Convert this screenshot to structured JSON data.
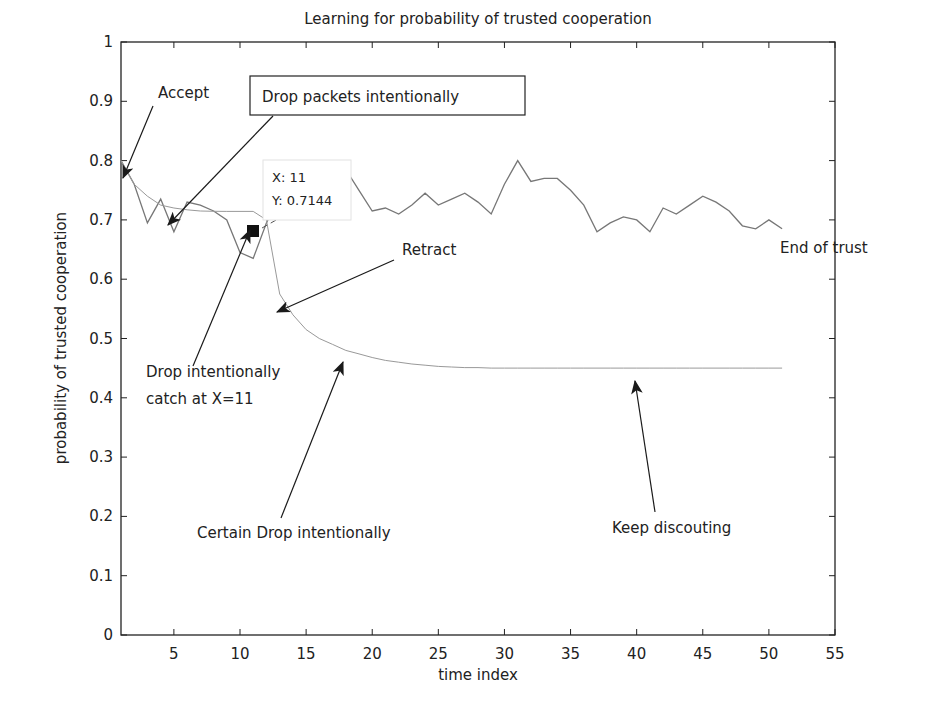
{
  "chart_data": {
    "type": "line",
    "title": "Learning for probability of trusted cooperation",
    "xlabel": "time index",
    "ylabel": "probability of trusted cooperation",
    "xlim": [
      1,
      55
    ],
    "ylim": [
      0,
      1
    ],
    "grid": false,
    "legend": null,
    "xticks": [
      5,
      10,
      15,
      20,
      25,
      30,
      35,
      40,
      45,
      50,
      55
    ],
    "yticks": [
      0,
      0.1,
      0.2,
      0.3,
      0.4,
      0.5,
      0.6,
      0.7,
      0.8,
      0.9,
      1
    ],
    "xtick_labels": [
      "5",
      "10",
      "15",
      "20",
      "25",
      "30",
      "35",
      "40",
      "45",
      "50",
      "55"
    ],
    "ytick_labels": [
      "0",
      "0.1",
      "0.2",
      "0.3",
      "0.4",
      "0.5",
      "0.6",
      "0.7",
      "0.8",
      "0.9",
      "1"
    ],
    "series": [
      {
        "name": "observed cooperation (fluctuating)",
        "color": "#777777",
        "x": [
          1,
          2,
          3,
          4,
          5,
          6,
          7,
          8,
          9,
          10,
          11,
          12,
          13,
          14,
          15,
          16,
          17,
          18,
          19,
          20,
          21,
          22,
          23,
          24,
          25,
          26,
          27,
          28,
          29,
          30,
          31,
          32,
          33,
          34,
          35,
          36,
          37,
          38,
          39,
          40,
          41,
          42,
          43,
          44,
          45,
          46,
          47,
          48,
          49,
          50,
          51
        ],
        "values": [
          0.8,
          0.76,
          0.695,
          0.735,
          0.68,
          0.73,
          0.725,
          0.715,
          0.7,
          0.645,
          0.635,
          0.695,
          0.74,
          0.75,
          0.745,
          0.72,
          0.76,
          0.785,
          0.75,
          0.715,
          0.72,
          0.71,
          0.725,
          0.745,
          0.725,
          0.735,
          0.745,
          0.73,
          0.71,
          0.76,
          0.8,
          0.765,
          0.77,
          0.77,
          0.75,
          0.725,
          0.68,
          0.695,
          0.705,
          0.7,
          0.68,
          0.72,
          0.71,
          0.725,
          0.74,
          0.73,
          0.715,
          0.69,
          0.685,
          0.7,
          0.685
        ]
      },
      {
        "name": "learned trust probability (discounted)",
        "color": "#999999",
        "x": [
          1,
          2,
          3,
          4,
          5,
          6,
          7,
          8,
          9,
          10,
          11,
          12,
          13,
          14,
          15,
          16,
          17,
          18,
          19,
          20,
          21,
          22,
          23,
          24,
          25,
          26,
          27,
          28,
          29,
          30,
          31,
          32,
          33,
          34,
          35,
          36,
          37,
          38,
          39,
          40,
          41,
          42,
          43,
          44,
          45,
          46,
          47,
          48,
          49,
          50,
          51
        ],
        "values": [
          0.8,
          0.76,
          0.74,
          0.725,
          0.72,
          0.717,
          0.715,
          0.7145,
          0.7144,
          0.7144,
          0.7144,
          0.7,
          0.575,
          0.54,
          0.515,
          0.5,
          0.49,
          0.48,
          0.474,
          0.468,
          0.463,
          0.46,
          0.457,
          0.455,
          0.453,
          0.452,
          0.451,
          0.451,
          0.45,
          0.45,
          0.45,
          0.45,
          0.45,
          0.45,
          0.45,
          0.45,
          0.45,
          0.45,
          0.45,
          0.45,
          0.45,
          0.45,
          0.45,
          0.45,
          0.45,
          0.45,
          0.45,
          0.45,
          0.45,
          0.45,
          0.45
        ]
      }
    ],
    "datatip": {
      "x_label": "X: 11",
      "y_label": "Y: 0.7144",
      "x": 11,
      "y": 0.7144
    },
    "annotations": [
      {
        "text": "Accept",
        "target": [
          1,
          0.8
        ]
      },
      {
        "text": "Drop packets intentionally",
        "target": [
          4.2,
          0.72
        ],
        "boxed": true
      },
      {
        "text": "Drop intentionally catch at X=11",
        "lines": [
          "Drop intentionally",
          "catch at X=11"
        ],
        "target": [
          11,
          0.7144
        ]
      },
      {
        "text": "Retract",
        "target": [
          13,
          0.57
        ]
      },
      {
        "text": "Certain Drop intentionally",
        "target": [
          18,
          0.485
        ]
      },
      {
        "text": "Keep discouting",
        "target": [
          39.5,
          0.45
        ]
      },
      {
        "text": "End of trust",
        "target": [
          51,
          0.685
        ]
      }
    ]
  }
}
